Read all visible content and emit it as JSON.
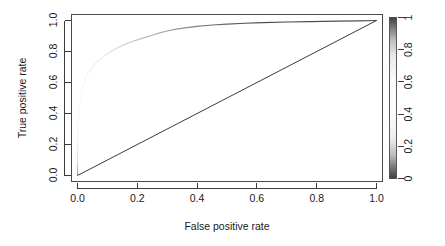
{
  "figure": {
    "background_color": "#ffffff",
    "axis_color": "#3b3b3b",
    "curve_color_dark": "#4d4d4d",
    "curve_color_light": "#f2f2f2",
    "diagonal_color": "#3a3a3a"
  },
  "chart_data": {
    "type": "line",
    "title": "",
    "subtitle": "",
    "xlabel": "False positive rate",
    "ylabel": "True positive rate",
    "xlim": [
      -0.04,
      1.04
    ],
    "ylim": [
      -0.04,
      1.04
    ],
    "grid": false,
    "legend_position": "right-colorbar",
    "xticks": [
      0.0,
      0.2,
      0.4,
      0.6,
      0.8,
      1.0
    ],
    "xticklabels": [
      "0.0",
      "0.2",
      "0.4",
      "0.6",
      "0.8",
      "1.0"
    ],
    "yticks": [
      0.0,
      0.2,
      0.4,
      0.6,
      0.8,
      1.0
    ],
    "yticklabels": [
      "0.0",
      "0.2",
      "0.4",
      "0.6",
      "0.8",
      "1.0"
    ],
    "series": [
      {
        "name": "ROC curve",
        "colored_by": "cutoff",
        "x": [
          0.0,
          0.0,
          0.0,
          0.0,
          0.002,
          0.004,
          0.006,
          0.009,
          0.012,
          0.016,
          0.02,
          0.026,
          0.032,
          0.04,
          0.048,
          0.058,
          0.068,
          0.08,
          0.092,
          0.106,
          0.12,
          0.136,
          0.152,
          0.17,
          0.188,
          0.208,
          0.228,
          0.25,
          0.275,
          0.3,
          0.33,
          0.36,
          0.4,
          0.45,
          0.5,
          0.56,
          0.62,
          0.7,
          0.78,
          0.87,
          0.94,
          1.0
        ],
        "y": [
          0.0,
          0.08,
          0.17,
          0.26,
          0.33,
          0.39,
          0.44,
          0.485,
          0.525,
          0.56,
          0.592,
          0.622,
          0.65,
          0.675,
          0.698,
          0.718,
          0.737,
          0.756,
          0.775,
          0.793,
          0.81,
          0.826,
          0.841,
          0.855,
          0.868,
          0.88,
          0.893,
          0.905,
          0.92,
          0.932,
          0.944,
          0.952,
          0.962,
          0.971,
          0.977,
          0.982,
          0.986,
          0.99,
          0.993,
          0.996,
          0.998,
          1.0
        ]
      },
      {
        "name": "Chance diagonal",
        "x": [
          0.0,
          1.0
        ],
        "y": [
          0.0,
          1.0
        ]
      }
    ]
  },
  "colorbar": {
    "name": "cutoff-colorbar",
    "ticks": [
      0,
      0.2,
      0.4,
      0.6,
      0.8,
      1
    ],
    "ticklabels": [
      "0",
      "0.2",
      "0.4",
      "0.6",
      "0.8",
      "1"
    ],
    "gradient_stops": [
      {
        "offset": "0%",
        "color": "#3f3f3f"
      },
      {
        "offset": "6%",
        "color": "#6e6e6e"
      },
      {
        "offset": "14%",
        "color": "#b9b9b9"
      },
      {
        "offset": "24%",
        "color": "#ebebeb"
      },
      {
        "offset": "40%",
        "color": "#fbfbfb"
      },
      {
        "offset": "60%",
        "color": "#fbfbfb"
      },
      {
        "offset": "76%",
        "color": "#eaeaea"
      },
      {
        "offset": "86%",
        "color": "#bdbdbd"
      },
      {
        "offset": "94%",
        "color": "#767676"
      },
      {
        "offset": "100%",
        "color": "#3f3f3f"
      }
    ]
  }
}
